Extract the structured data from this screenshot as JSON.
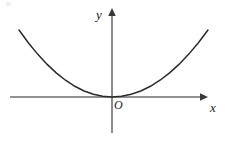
{
  "figure": {
    "background_color": "#ffffff",
    "stroke_color": "#2b2b2b",
    "axis_color": "#6e6e6e",
    "label_color": "#1a1a1a",
    "width": 229,
    "height": 141
  },
  "labels": {
    "y_axis": "y",
    "x_axis": "x",
    "origin": "O"
  },
  "chart_data": {
    "type": "line",
    "title": "",
    "subtitle": "",
    "xlabel": "x",
    "ylabel": "y",
    "annotations": [
      "O"
    ],
    "legend": [],
    "legend_position": "none",
    "grid": false,
    "xlim": [
      -1.1,
      1.05
    ],
    "ylim": [
      -0.42,
      0.94
    ],
    "axes": {
      "origin_px": [
        112,
        97
      ],
      "x_axis_px": {
        "x_start": 10,
        "x_end": 205,
        "y": 97,
        "arrow": "right"
      },
      "y_axis_px": {
        "y_start": 10,
        "y_end": 133,
        "x": 112,
        "arrow": "up"
      }
    },
    "series": [
      {
        "name": "parabola",
        "equation": "y = x^2",
        "color": "#2b2b2b",
        "x": [
          -1.0,
          -0.9,
          -0.8,
          -0.7,
          -0.6,
          -0.5,
          -0.4,
          -0.3,
          -0.2,
          -0.1,
          0.0,
          0.1,
          0.2,
          0.3,
          0.4,
          0.5,
          0.6,
          0.7,
          0.8,
          0.9,
          1.0
        ],
        "values": [
          1.0,
          0.81,
          0.64,
          0.49,
          0.36,
          0.25,
          0.16,
          0.09,
          0.04,
          0.01,
          0.0,
          0.01,
          0.04,
          0.09,
          0.16,
          0.25,
          0.36,
          0.49,
          0.64,
          0.81,
          1.0
        ],
        "vertex": [
          0,
          0
        ],
        "endpoints_px": [
          [
            19,
            30
          ],
          [
            208,
            30
          ]
        ]
      }
    ]
  }
}
